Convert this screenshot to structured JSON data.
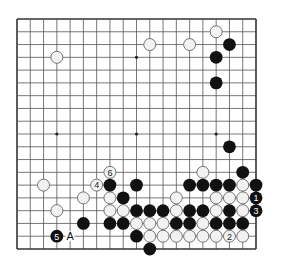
{
  "diagram": {
    "type": "go-board",
    "board_size": 19,
    "colors": {
      "background": "#ffffff",
      "grid": "#555555",
      "frame": "#333333",
      "black_stone": "#111111",
      "white_stone_fill": "#f2f2f2",
      "white_stone_edge": "#666666",
      "star_point": "#222222"
    },
    "star_points": [
      [
        3,
        3
      ],
      [
        9,
        3
      ],
      [
        15,
        3
      ],
      [
        3,
        9
      ],
      [
        9,
        9
      ],
      [
        15,
        9
      ],
      [
        3,
        15
      ],
      [
        9,
        15
      ],
      [
        15,
        15
      ]
    ],
    "stones": {
      "white": [
        [
          15,
          1
        ],
        [
          10,
          2
        ],
        [
          13,
          2
        ],
        [
          3,
          3
        ],
        [
          14,
          12
        ],
        [
          2,
          13
        ],
        [
          17,
          13
        ],
        [
          5,
          14
        ],
        [
          7,
          14
        ],
        [
          12,
          14
        ],
        [
          15,
          14
        ],
        [
          16,
          14
        ],
        [
          17,
          14
        ],
        [
          3,
          15
        ],
        [
          7,
          15
        ],
        [
          8,
          15
        ],
        [
          12,
          15
        ],
        [
          15,
          15
        ],
        [
          17,
          15
        ],
        [
          9,
          16
        ],
        [
          10,
          16
        ],
        [
          11,
          16
        ],
        [
          14,
          16
        ],
        [
          10,
          17
        ],
        [
          11,
          17
        ],
        [
          12,
          17
        ],
        [
          13,
          17
        ],
        [
          14,
          17
        ],
        [
          15,
          17
        ],
        [
          17,
          17
        ]
      ],
      "black": [
        [
          16,
          2
        ],
        [
          15,
          3
        ],
        [
          15,
          5
        ],
        [
          16,
          10
        ],
        [
          17,
          12
        ],
        [
          7,
          13
        ],
        [
          9,
          13
        ],
        [
          13,
          13
        ],
        [
          14,
          13
        ],
        [
          15,
          13
        ],
        [
          16,
          13
        ],
        [
          18,
          13
        ],
        [
          8,
          14
        ],
        [
          9,
          15
        ],
        [
          10,
          15
        ],
        [
          11,
          15
        ],
        [
          13,
          15
        ],
        [
          14,
          15
        ],
        [
          16,
          15
        ],
        [
          5,
          16
        ],
        [
          7,
          16
        ],
        [
          8,
          16
        ],
        [
          12,
          16
        ],
        [
          13,
          16
        ],
        [
          15,
          16
        ],
        [
          16,
          16
        ],
        [
          17,
          16
        ],
        [
          9,
          17
        ],
        [
          10,
          18
        ]
      ]
    },
    "numbered_moves": [
      {
        "number": "1",
        "color": "black",
        "point": [
          18,
          14
        ]
      },
      {
        "number": "2",
        "color": "white",
        "point": [
          16,
          17
        ]
      },
      {
        "number": "3",
        "color": "black",
        "point": [
          18,
          15
        ]
      },
      {
        "number": "4",
        "color": "white",
        "point": [
          6,
          13
        ]
      },
      {
        "number": "5",
        "color": "black",
        "point": [
          3,
          17
        ]
      },
      {
        "number": "6",
        "color": "white",
        "point": [
          7,
          12
        ]
      }
    ],
    "letter_labels": [
      {
        "text": "A",
        "point": [
          4,
          17
        ]
      }
    ]
  }
}
